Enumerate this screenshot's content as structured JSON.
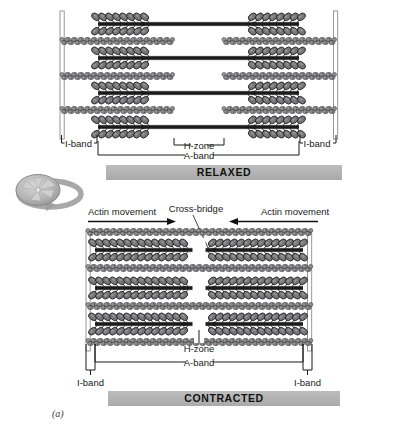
{
  "figure": {
    "caption": "(a)",
    "panels": [
      {
        "id": "relaxed",
        "state_label": "RELAXED",
        "bands": {
          "i_band_left": "I-band",
          "i_band_right": "I-band",
          "h_zone": "H-zone",
          "a_band": "A-band"
        },
        "myosin_rows": 4,
        "actin_rows": 3,
        "h_zone_gap_px": 95
      },
      {
        "id": "contracted",
        "state_label": "CONTRACTED",
        "bands": {
          "i_band_left": "I-band",
          "i_band_right": "I-band",
          "h_zone": "H-zone",
          "a_band": "A-band"
        },
        "myosin_rows": 3,
        "actin_rows": 4,
        "h_zone_gap_px": 14,
        "annotations": {
          "actin_movement_left": "Actin movement",
          "actin_movement_right": "Actin movement",
          "cross_bridge": "Cross-bridge"
        }
      }
    ],
    "rotate_icon": "rotate-3d-icon"
  },
  "colors": {
    "state_bar": "#b3b3b3",
    "myosin": "#77777a",
    "myosin_outline": "#1d1d1d",
    "actin": "#9a9a9e",
    "actin_outline": "#2a2a2a",
    "zline": "#8d8d8d",
    "text": "#1a1a1a",
    "icon_gray": "#9d9d9d"
  }
}
